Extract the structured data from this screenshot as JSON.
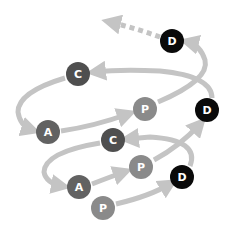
{
  "diagram": {
    "type": "spiral-cycle",
    "colors": {
      "arrow": "#c4c4c4",
      "plan": "#8a8a8a",
      "do": "#0a0a0a",
      "check": "#4f4f4f",
      "act": "#626262",
      "label": "#ffffff"
    },
    "nodes": [
      {
        "id": "p1",
        "label": "P",
        "x": 103,
        "y": 208
      },
      {
        "id": "d1",
        "label": "D",
        "x": 182,
        "y": 177
      },
      {
        "id": "c1",
        "label": "C",
        "x": 113,
        "y": 140
      },
      {
        "id": "a1",
        "label": "A",
        "x": 79,
        "y": 187
      },
      {
        "id": "p2",
        "label": "P",
        "x": 141,
        "y": 167
      },
      {
        "id": "d2",
        "label": "D",
        "x": 207,
        "y": 110
      },
      {
        "id": "c2",
        "label": "C",
        "x": 78,
        "y": 74
      },
      {
        "id": "a2",
        "label": "A",
        "x": 48,
        "y": 132
      },
      {
        "id": "p3",
        "label": "P",
        "x": 145,
        "y": 109
      },
      {
        "id": "d3",
        "label": "D",
        "x": 172,
        "y": 41
      }
    ],
    "continuation": "dotted arrow continuing upward-left from top D"
  }
}
